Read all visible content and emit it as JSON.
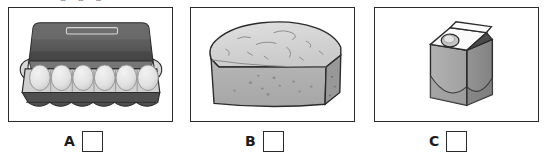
{
  "page": {
    "background_color": "#ffffff",
    "top_clipped_text": "p p p",
    "border_color": "#2b2b2b",
    "width": 546,
    "height": 162
  },
  "palette": {
    "outline": "#2b2b2b",
    "lid_dark": "#545454",
    "lid_mid": "#6d6d6d",
    "tray_mid": "#9a9a9a",
    "tray_light": "#c9c9c9",
    "egg_light": "#e8e8e8",
    "egg_shade": "#d2d2d2",
    "cup_dark": "#4f4f4f",
    "bread_top": "#d6d6d6",
    "bread_front": "#b0b0b0",
    "bread_side": "#9c9c9c",
    "carton_white": "#fbfbfb",
    "carton_front": "#a8a8a8",
    "carton_side": "#8e8e8e",
    "carton_gable_dark": "#4a4a4a",
    "cap_fill": "#c4c4c4"
  },
  "panels": [
    {
      "id": "panel-a",
      "item": "egg-carton",
      "item_label": "Open carton of eggs",
      "visible_eggs": 6,
      "answer_letter": "A"
    },
    {
      "id": "panel-b",
      "item": "bread-loaf",
      "item_label": "Loaf of bread",
      "answer_letter": "B"
    },
    {
      "id": "panel-c",
      "item": "milk-carton",
      "item_label": "Carton of milk",
      "answer_letter": "C"
    }
  ],
  "answers": {
    "checkbox_checked": false,
    "items": [
      {
        "letter": "A"
      },
      {
        "letter": "B"
      },
      {
        "letter": "C"
      }
    ]
  }
}
